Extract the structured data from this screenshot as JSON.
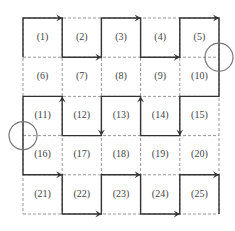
{
  "grid": {
    "rows": 5,
    "cols": 5,
    "x0": 23,
    "y0": 18,
    "cell": 39.2
  },
  "cells": [
    "(1)",
    "(2)",
    "(3)",
    "(4)",
    "(5)",
    "(6)",
    "(7)",
    "(8)",
    "(9)",
    "(10)",
    "(11)",
    "(12)",
    "(13)",
    "(14)",
    "(15)",
    "(16)",
    "(17)",
    "(18)",
    "(19)",
    "(20)",
    "(21)",
    "(22)",
    "(23)",
    "(24)",
    "(25)"
  ],
  "paths": [
    [
      [
        0,
        1
      ],
      [
        0,
        0
      ],
      [
        1,
        0
      ],
      [
        1,
        1
      ],
      [
        2,
        1
      ],
      [
        2,
        0
      ],
      [
        3,
        0
      ],
      [
        3,
        1
      ],
      [
        4,
        1
      ],
      [
        4,
        0
      ],
      [
        5,
        0
      ],
      [
        5,
        2
      ],
      [
        4,
        2
      ],
      [
        4,
        3
      ],
      [
        3,
        3
      ],
      [
        3,
        2
      ],
      [
        2,
        2
      ],
      [
        2,
        3
      ],
      [
        1,
        3
      ],
      [
        1,
        2
      ],
      [
        0,
        2
      ],
      [
        0,
        4
      ],
      [
        1,
        4
      ],
      [
        1,
        5
      ],
      [
        2,
        5
      ],
      [
        2,
        4
      ],
      [
        3,
        4
      ],
      [
        3,
        5
      ],
      [
        4,
        5
      ],
      [
        4,
        4
      ],
      [
        5,
        4
      ],
      [
        5,
        5
      ]
    ]
  ],
  "arrows": [
    [
      [
        0,
        0
      ],
      [
        1,
        0
      ]
    ],
    [
      [
        1,
        1
      ],
      [
        2,
        1
      ]
    ],
    [
      [
        2,
        0
      ],
      [
        3,
        0
      ]
    ],
    [
      [
        3,
        1
      ],
      [
        4,
        1
      ]
    ],
    [
      [
        4,
        0
      ],
      [
        5,
        0
      ]
    ],
    [
      [
        4,
        2
      ],
      [
        4,
        3
      ]
    ],
    [
      [
        3,
        3
      ],
      [
        3,
        2
      ]
    ],
    [
      [
        2,
        2
      ],
      [
        2,
        3
      ]
    ],
    [
      [
        1,
        3
      ],
      [
        1,
        2
      ]
    ],
    [
      [
        0,
        4
      ],
      [
        1,
        4
      ]
    ],
    [
      [
        1,
        5
      ],
      [
        2,
        5
      ]
    ],
    [
      [
        2,
        4
      ],
      [
        3,
        4
      ]
    ],
    [
      [
        3,
        5
      ],
      [
        4,
        5
      ]
    ],
    [
      [
        4,
        4
      ],
      [
        5,
        4
      ]
    ]
  ],
  "circles": [
    [
      5,
      1
    ],
    [
      0,
      3
    ]
  ],
  "colors": {
    "solid": "#333333",
    "dashed": "#999999",
    "circle": "#777777"
  }
}
